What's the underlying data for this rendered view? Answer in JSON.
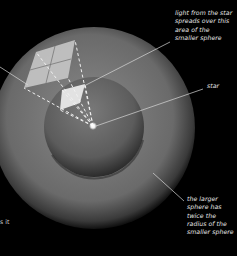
{
  "figure": {
    "background": "#000000",
    "colors": {
      "large_sphere_center": "#8a8a8a",
      "large_sphere_edge": "#1a1a1a",
      "small_sphere_center": "#6e6e6e",
      "small_sphere_edge": "#2a2a2a",
      "patch_fill": "#c8c8c8",
      "leader_line": "#d8d8d8",
      "star": "#ffffff"
    }
  },
  "labels": {
    "light_area": "light from the star\nspreads over this\narea of the\nsmaller sphere",
    "star": "star",
    "larger_sphere": "the larger\nsphere has\ntwice the\nradius of the\nsmaller sphere",
    "partial_left": "s it"
  },
  "geometry": {
    "large_sphere": {
      "cx": 94,
      "cy": 128,
      "r": 101
    },
    "small_sphere": {
      "cx": 94,
      "cy": 127,
      "r": 50
    },
    "star": {
      "x": 93,
      "y": 126
    }
  }
}
